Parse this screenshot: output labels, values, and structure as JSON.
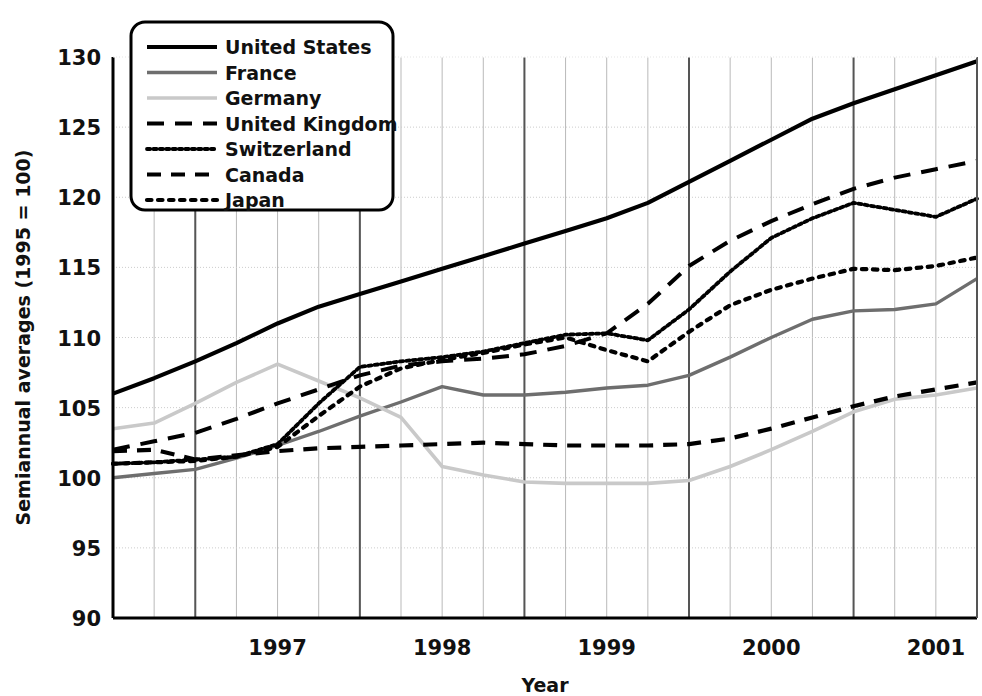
{
  "figure": {
    "width": 982,
    "height": 696,
    "background": "#ffffff"
  },
  "chart_data": {
    "type": "line",
    "title": "",
    "xlabel": "Year",
    "ylabel": "Semiannual averages (1995 = 100)",
    "xlim": [
      1996.5,
      2001.75
    ],
    "ylim": [
      90,
      130
    ],
    "yticks": [
      90,
      95,
      100,
      105,
      110,
      115,
      120,
      125,
      130
    ],
    "xticks": [
      1997,
      1998,
      1999,
      2000,
      2001
    ],
    "xtick_labels": [
      "1997",
      "1998",
      "1999",
      "2000",
      "2001"
    ],
    "grid": true,
    "grid_major_x": [
      1997.0,
      1998.0,
      1999.0,
      2000.0,
      2001.0
    ],
    "grid_minor_x_step": 0.25,
    "legend_position": "top-left",
    "x": [
      1996.5,
      1996.75,
      1997.0,
      1997.25,
      1997.5,
      1997.75,
      1998.0,
      1998.25,
      1998.5,
      1998.75,
      1999.0,
      1999.25,
      1999.5,
      1999.75,
      2000.0,
      2000.25,
      2000.5,
      2000.75,
      2001.0,
      2001.25,
      2001.5,
      2001.75
    ],
    "series": [
      {
        "name": "United States",
        "color": "#000000",
        "dash": "solid",
        "width": 4.2,
        "values": [
          106.0,
          107.1,
          108.3,
          109.6,
          111.0,
          112.2,
          113.1,
          114.0,
          114.9,
          115.8,
          116.7,
          117.6,
          118.5,
          119.6,
          121.1,
          122.6,
          124.1,
          125.6,
          126.7,
          127.7,
          128.7,
          129.7
        ]
      },
      {
        "name": "France",
        "color": "#6e6e6e",
        "dash": "solid",
        "width": 3.4,
        "values": [
          100.0,
          100.3,
          100.6,
          101.4,
          102.3,
          103.3,
          104.4,
          105.4,
          106.5,
          105.9,
          105.9,
          106.1,
          106.4,
          106.6,
          107.3,
          108.6,
          110.0,
          111.3,
          111.9,
          112.0,
          112.4,
          114.2
        ]
      },
      {
        "name": "Germany",
        "color": "#c9c9c9",
        "dash": "solid",
        "width": 3.6,
        "values": [
          103.5,
          103.9,
          105.3,
          106.8,
          108.1,
          106.9,
          105.7,
          104.3,
          100.8,
          100.2,
          99.7,
          99.6,
          99.6,
          99.6,
          99.8,
          100.8,
          102.0,
          103.3,
          104.7,
          105.6,
          105.9,
          106.4
        ]
      },
      {
        "name": "United Kingdom",
        "color": "#000000",
        "dash": "dashed-long",
        "width": 4.0,
        "values": [
          102.0,
          102.6,
          103.2,
          104.2,
          105.3,
          106.3,
          107.3,
          108.0,
          108.3,
          108.5,
          108.8,
          109.4,
          110.3,
          112.4,
          115.1,
          116.9,
          118.3,
          119.5,
          120.6,
          121.4,
          122.0,
          122.6
        ]
      },
      {
        "name": "Switzerland",
        "color": "#000000",
        "dash": "dotted-fine",
        "width": 3.8,
        "values": [
          101.0,
          101.1,
          101.3,
          101.5,
          102.4,
          105.3,
          107.9,
          108.3,
          108.6,
          109.0,
          109.6,
          110.2,
          110.3,
          109.8,
          112.0,
          114.7,
          117.1,
          118.5,
          119.6,
          119.1,
          118.6,
          119.9
        ]
      },
      {
        "name": "Canada",
        "color": "#000000",
        "dash": "dashed-med",
        "width": 4.2,
        "values": [
          101.9,
          102.0,
          101.3,
          101.6,
          101.9,
          102.1,
          102.2,
          102.3,
          102.4,
          102.5,
          102.4,
          102.3,
          102.3,
          102.3,
          102.4,
          102.8,
          103.5,
          104.3,
          105.1,
          105.8,
          106.3,
          106.8
        ]
      },
      {
        "name": "Japan",
        "color": "#000000",
        "dash": "dotted-coarse",
        "width": 4.2,
        "values": [
          101.0,
          101.1,
          101.2,
          101.5,
          102.2,
          104.4,
          106.5,
          107.8,
          108.4,
          108.9,
          109.5,
          110.0,
          109.1,
          108.3,
          110.4,
          112.3,
          113.4,
          114.2,
          114.9,
          114.8,
          115.1,
          115.7
        ]
      }
    ]
  },
  "legend": {
    "items": [
      {
        "label": "United States"
      },
      {
        "label": "France"
      },
      {
        "label": "Germany"
      },
      {
        "label": "United Kingdom"
      },
      {
        "label": "Switzerland"
      },
      {
        "label": "Canada"
      },
      {
        "label": "Japan"
      }
    ]
  }
}
